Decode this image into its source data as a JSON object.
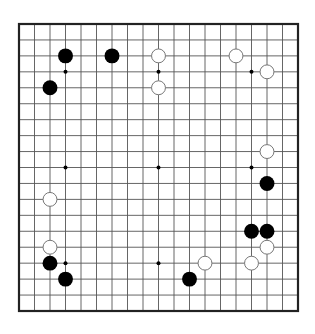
{
  "board": {
    "size": 19,
    "colors": {
      "background": "#ffffff",
      "line": "#555555",
      "border": "#222222",
      "black_stone": "#000000",
      "white_stone_fill": "#ffffff",
      "white_stone_stroke": "#777777",
      "star_point": "#000000"
    },
    "star_points": [
      [
        4,
        4
      ],
      [
        10,
        4
      ],
      [
        16,
        4
      ],
      [
        4,
        10
      ],
      [
        10,
        10
      ],
      [
        16,
        10
      ],
      [
        4,
        16
      ],
      [
        10,
        16
      ],
      [
        16,
        16
      ]
    ],
    "stones": [
      {
        "color": "black",
        "col": 4,
        "row": 3
      },
      {
        "color": "black",
        "col": 7,
        "row": 3
      },
      {
        "color": "black",
        "col": 3,
        "row": 5
      },
      {
        "color": "black",
        "col": 17,
        "row": 11
      },
      {
        "color": "black",
        "col": 16,
        "row": 14
      },
      {
        "color": "black",
        "col": 17,
        "row": 14
      },
      {
        "color": "black",
        "col": 3,
        "row": 16
      },
      {
        "color": "black",
        "col": 4,
        "row": 17
      },
      {
        "color": "black",
        "col": 12,
        "row": 17
      },
      {
        "color": "white",
        "col": 10,
        "row": 3
      },
      {
        "color": "white",
        "col": 10,
        "row": 5
      },
      {
        "color": "white",
        "col": 15,
        "row": 3
      },
      {
        "color": "white",
        "col": 17,
        "row": 4
      },
      {
        "color": "white",
        "col": 17,
        "row": 9
      },
      {
        "color": "white",
        "col": 3,
        "row": 12
      },
      {
        "color": "white",
        "col": 3,
        "row": 15
      },
      {
        "color": "white",
        "col": 17,
        "row": 15
      },
      {
        "color": "white",
        "col": 13,
        "row": 16
      },
      {
        "color": "white",
        "col": 16,
        "row": 16
      }
    ]
  }
}
